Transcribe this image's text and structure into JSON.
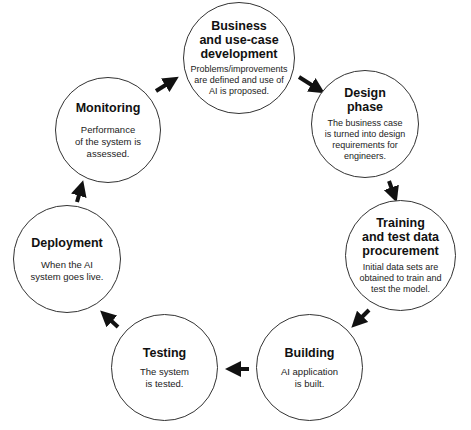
{
  "diagram": {
    "type": "cycle",
    "colors": {
      "stroke": "#333333",
      "arrow": "#111111",
      "background": "#ffffff",
      "text": "#111111"
    },
    "nodes": [
      {
        "id": "business",
        "title": "Business\nand use-case\ndevelopment",
        "desc": "Problems/improvements\nare defined and use of\nAI is proposed."
      },
      {
        "id": "design",
        "title": "Design\nphase",
        "desc": "The business case\nis turned into design\nrequirements for\nengineers."
      },
      {
        "id": "training",
        "title": "Training\nand test data\nprocurement",
        "desc": "Initial data sets are\nobtained to train and\ntest the model."
      },
      {
        "id": "building",
        "title": "Building",
        "desc": "AI application\nis built."
      },
      {
        "id": "testing",
        "title": "Testing",
        "desc": "The system\nis tested."
      },
      {
        "id": "deployment",
        "title": "Deployment",
        "desc": "When the AI\nsystem goes live."
      },
      {
        "id": "monitoring",
        "title": "Monitoring",
        "desc": "Performance\nof the system is\nassessed."
      }
    ],
    "edges": [
      {
        "from": "business",
        "to": "design"
      },
      {
        "from": "design",
        "to": "training"
      },
      {
        "from": "training",
        "to": "building"
      },
      {
        "from": "building",
        "to": "testing"
      },
      {
        "from": "testing",
        "to": "deployment"
      },
      {
        "from": "deployment",
        "to": "monitoring"
      },
      {
        "from": "monitoring",
        "to": "business"
      }
    ]
  }
}
